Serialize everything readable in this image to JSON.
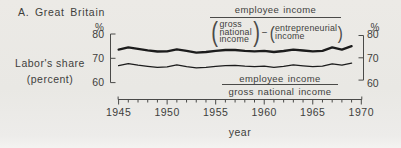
{
  "colors": {
    "background": "#e9e8e4",
    "ink": "#3e3e3c",
    "axis": "#4a4a48",
    "curve": "#1c1c1c"
  },
  "title": "A. Great Britain",
  "y_axis": {
    "label_line1": "Labor's share",
    "label_line2": "(percent)",
    "unit": "%",
    "ticks": [
      80,
      70,
      60
    ]
  },
  "x_axis": {
    "label": "year",
    "ticks": [
      1945,
      1950,
      1955,
      1960,
      1965,
      1970
    ]
  },
  "formula_upper": {
    "numerator": "employee income",
    "denominator_left": [
      "gross",
      "national",
      "income"
    ],
    "paren": [
      "(",
      ")"
    ],
    "operator": "−",
    "denominator_right": [
      "entrepreneurial",
      "income"
    ]
  },
  "formula_lower": {
    "numerator": "employee income",
    "denominator": "gross national income"
  },
  "chart_data": {
    "type": "line",
    "title": "A. Great Britain",
    "xlabel": "year",
    "ylabel": "Labor's share (percent)",
    "xlim": [
      1944.3,
      1970.7
    ],
    "ylim": [
      60,
      80
    ],
    "y_ticks": [
      60,
      70,
      80
    ],
    "x_ticks": [
      1945,
      1950,
      1955,
      1960,
      1965,
      1970
    ],
    "minor_x_tick_step": 1,
    "grid": false,
    "legend_position": "annotations-on-plot",
    "x": [
      1945,
      1946,
      1947,
      1948,
      1949,
      1950,
      1951,
      1952,
      1953,
      1954,
      1955,
      1956,
      1957,
      1958,
      1959,
      1960,
      1961,
      1962,
      1963,
      1964,
      1965,
      1966,
      1967,
      1968,
      1969
    ],
    "series": [
      {
        "name": "employee income / (gross national income − entrepreneurial income)",
        "line_weight": "thick",
        "values": [
          73.6,
          74.5,
          73.9,
          73.3,
          72.8,
          72.9,
          73.7,
          73.1,
          72.3,
          72.6,
          73.1,
          73.4,
          73.4,
          73.1,
          72.9,
          73.1,
          72.6,
          73.0,
          73.6,
          73.2,
          72.9,
          73.1,
          74.5,
          73.6,
          75.0
        ]
      },
      {
        "name": "employee income / gross national income",
        "line_weight": "thin",
        "values": [
          67.0,
          67.8,
          67.2,
          66.7,
          66.3,
          66.5,
          67.3,
          66.6,
          66.1,
          66.3,
          66.7,
          67.0,
          67.1,
          66.8,
          66.6,
          66.8,
          66.3,
          66.7,
          67.3,
          66.9,
          66.6,
          66.8,
          67.7,
          67.2,
          68.0
        ]
      }
    ]
  }
}
